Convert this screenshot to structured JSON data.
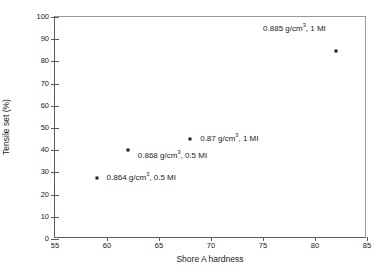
{
  "chart_data": {
    "type": "scatter",
    "title": "",
    "xlabel": "Shore A hardness",
    "ylabel": "Tensile set (%)",
    "xlim": [
      55,
      85
    ],
    "ylim": [
      0,
      100
    ],
    "xticks": [
      55,
      60,
      65,
      70,
      75,
      80,
      85
    ],
    "yticks": [
      0,
      10,
      20,
      30,
      40,
      50,
      60,
      70,
      80,
      90,
      100
    ],
    "grid": false,
    "legend": "none",
    "marker_color": "#1a1a1a",
    "axis_color": "#5a5a5a",
    "background": "#ffffff",
    "points": [
      {
        "x": 59,
        "y": 27.5,
        "label_density": "0.864",
        "label_units": "g/cm",
        "label_exp": "3",
        "label_mi": ", 0.5 MI",
        "label_full": "0.864 g/cm3, 0.5 MI",
        "label_side": "right"
      },
      {
        "x": 62,
        "y": 40,
        "label_density": "0.868",
        "label_units": "g/cm",
        "label_exp": "3",
        "label_mi": ", 0.5 MI",
        "label_full": "0.868 g/cm3, 0.5 MI",
        "label_side": "right-below"
      },
      {
        "x": 68,
        "y": 45,
        "label_density": "0.87",
        "label_units": "g/cm",
        "label_exp": "3",
        "label_mi": ", 1 MI",
        "label_full": "0.87 g/cm3, 1 MI",
        "label_side": "right"
      },
      {
        "x": 82,
        "y": 84.5,
        "label_density": "0.885",
        "label_units": "g/cm",
        "label_exp": "3",
        "label_mi": ", 1 MI",
        "label_full": "0.885 g/cm3, 1 MI",
        "label_side": "above-left"
      }
    ]
  },
  "axes": {
    "x_title": "Shore A hardness",
    "y_title": "Tensile set (%)",
    "x_tick_labels": [
      "55",
      "60",
      "65",
      "70",
      "75",
      "80",
      "85"
    ],
    "y_tick_labels": [
      "0",
      "10",
      "20",
      "30",
      "40",
      "50",
      "60",
      "70",
      "80",
      "90",
      "100"
    ]
  }
}
